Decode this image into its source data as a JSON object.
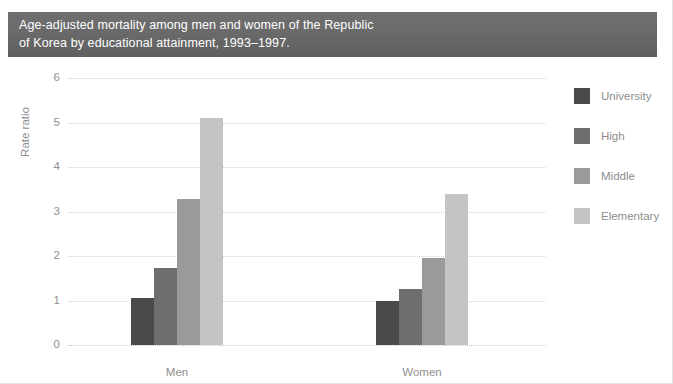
{
  "title": {
    "line1": "Age-adjusted mortality among men and women of the Republic",
    "line2": "of Korea by educational attainment, 1993–1997."
  },
  "axis": {
    "y_title": "Rate ratio",
    "y_ticks": [
      "6",
      "5",
      "4",
      "3",
      "2",
      "1",
      "0"
    ]
  },
  "legend": {
    "items": [
      {
        "label": "University",
        "color": "#4a4a4a"
      },
      {
        "label": "High",
        "color": "#6e6e6e"
      },
      {
        "label": "Middle",
        "color": "#9a9a9a"
      },
      {
        "label": "Elementary",
        "color": "#c4c4c4"
      }
    ]
  },
  "categories": [
    "Men",
    "Women"
  ],
  "chart_data": {
    "type": "bar",
    "title": "Age-adjusted mortality among men and women of the Republic of Korea by educational attainment, 1993–1997.",
    "xlabel": "",
    "ylabel": "Rate ratio",
    "ylim": [
      0,
      6
    ],
    "yticks": [
      0,
      1,
      2,
      3,
      4,
      5,
      6
    ],
    "grid": true,
    "legend_position": "right",
    "categories": [
      "Men",
      "Women"
    ],
    "series": [
      {
        "name": "University",
        "color": "#4a4a4a",
        "values": [
          1.05,
          1.0
        ]
      },
      {
        "name": "High",
        "color": "#6e6e6e",
        "values": [
          1.73,
          1.25
        ]
      },
      {
        "name": "Middle",
        "color": "#9a9a9a",
        "values": [
          3.28,
          1.95
        ]
      },
      {
        "name": "Elementary",
        "color": "#c4c4c4",
        "values": [
          5.1,
          3.4
        ]
      }
    ]
  }
}
